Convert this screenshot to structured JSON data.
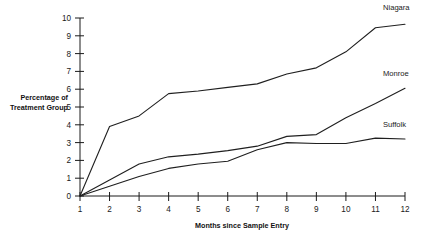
{
  "chart_data": {
    "type": "line",
    "title": "",
    "xlabel": "Months since Sample Entry",
    "ylabel": "Percentage of Treatment Group",
    "ylabel_line1": "Percentage of",
    "ylabel_line2": "Treatment Group",
    "x": [
      1,
      2,
      3,
      4,
      5,
      6,
      7,
      8,
      9,
      10,
      11,
      12
    ],
    "xticklabels": [
      "1",
      "2",
      "3",
      "4",
      "5",
      "6",
      "7",
      "8",
      "9",
      "10",
      "11",
      "12"
    ],
    "yticklabels": [
      "0",
      "1",
      "2",
      "3",
      "4",
      "5",
      "6",
      "7",
      "8",
      "9",
      "10"
    ],
    "yticks": [
      0,
      1,
      2,
      3,
      4,
      5,
      6,
      7,
      8,
      9,
      10
    ],
    "xlim": [
      1,
      12
    ],
    "ylim": [
      0,
      10
    ],
    "grid": false,
    "legend_position": "right-of-line-ends",
    "line_color": "#1f1f1f",
    "series": [
      {
        "name": "Niagara",
        "values": [
          0,
          3.9,
          4.5,
          5.75,
          5.9,
          6.1,
          6.3,
          6.85,
          7.2,
          8.1,
          9.45,
          9.65
        ]
      },
      {
        "name": "Monroe",
        "values": [
          0,
          0.9,
          1.8,
          2.2,
          2.35,
          2.55,
          2.8,
          3.35,
          3.45,
          4.4,
          5.2,
          6.05
        ]
      },
      {
        "name": "Suffolk",
        "values": [
          0,
          0.55,
          1.1,
          1.55,
          1.8,
          1.95,
          2.6,
          3.0,
          2.95,
          2.95,
          3.25,
          3.2
        ]
      }
    ]
  }
}
